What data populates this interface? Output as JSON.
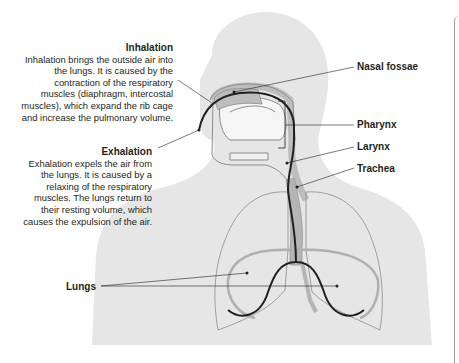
{
  "diagram": {
    "annotations": {
      "inhalation": {
        "title": "Inhalation",
        "body": "Inhalation brings the outside air into the lungs. It is caused by the contraction of the respiratory muscles (diaphragm, intercostal muscles), which expand the rib cage and increase the pulmonary volume."
      },
      "exhalation": {
        "title": "Exhalation",
        "body": "Exhalation expels the air from the lungs. It is caused by a relaxing of the respiratory muscles. The lungs return to their resting volume, which causes the expulsion of the air."
      }
    },
    "labels": {
      "nasal_fossae": "Nasal fossae",
      "pharynx": "Pharynx",
      "larynx": "Larynx",
      "trachea": "Trachea",
      "lungs": "Lungs"
    },
    "colors": {
      "body_silhouette": "#e6e6e6",
      "organ_fill": "#bdbdbd",
      "outline": "#8c8c8c",
      "airflow_line": "#231f20",
      "text": "#231f20"
    }
  }
}
